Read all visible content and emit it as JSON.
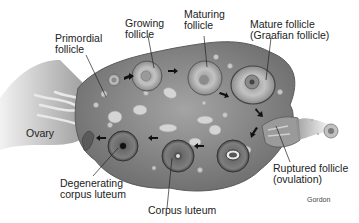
{
  "diagram": {
    "labels": {
      "primordial": "Primordial\nfollicle",
      "growing": "Growing\nfollicle",
      "maturing": "Maturing\nfollicle",
      "mature": "Mature follicle\n(Graafian follicle)",
      "ovary": "Ovary",
      "degenerating": "Degenerating\ncorpus luteum",
      "corpus_luteum": "Corpus luteum",
      "ruptured": "Ruptured follicle\n(ovulation)"
    },
    "credit": "Gordon",
    "stages_sequence": [
      "Primordial follicle",
      "Growing follicle",
      "Maturing follicle",
      "Mature follicle (Graafian follicle)",
      "Ruptured follicle (ovulation)",
      "Corpus luteum",
      "Degenerating corpus luteum"
    ],
    "colors": {
      "ovary_fill": "#8a8a8a",
      "ovary_edge": "#5a5a5a",
      "follicle_fill": "#b5b5b5",
      "luteum_fill": "#6e6e6e",
      "arrow": "#111111",
      "text": "#222222"
    }
  }
}
